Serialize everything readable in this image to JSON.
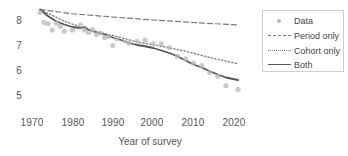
{
  "chart_data": {
    "type": "scatter",
    "title": "",
    "xlabel": "Year of survey",
    "ylabel": "",
    "xlim": [
      1968,
      2024
    ],
    "ylim": [
      4.7,
      8.45
    ],
    "grid": false,
    "xticks": [
      1970,
      1980,
      1990,
      2000,
      2010,
      2020
    ],
    "xtick_labels": [
      "1970",
      "1980",
      "1990",
      "2000",
      "2010",
      "2020"
    ],
    "yticks": [
      5,
      6,
      7,
      8
    ],
    "ytick_labels": [
      "5",
      "6",
      "7",
      "8"
    ],
    "legend": {
      "position": "upper right",
      "entries": [
        {
          "label": "Data",
          "style": "marker",
          "color": "#b8b8b8"
        },
        {
          "label": "Period only",
          "style": "dashed",
          "color": "#7a7a7a"
        },
        {
          "label": "Cohort only",
          "style": "dotted",
          "color": "#7a7a7a"
        },
        {
          "label": "Both",
          "style": "solid",
          "color": "#555555"
        }
      ]
    },
    "series": [
      {
        "name": "Data",
        "type": "scatter",
        "color": "#b8b8b8",
        "x": [
          1972,
          1973,
          1974,
          1975,
          1976,
          1977,
          1978,
          1980,
          1982,
          1983,
          1984,
          1985,
          1986,
          1987,
          1988,
          1989,
          1990,
          1991,
          1993,
          1994,
          1996,
          1998,
          2000,
          2002,
          2004,
          2006,
          2008,
          2010,
          2012,
          2014,
          2016,
          2018,
          2021
        ],
        "y": [
          8.3,
          7.9,
          7.85,
          7.6,
          7.88,
          7.75,
          7.55,
          7.6,
          7.8,
          7.6,
          7.5,
          7.62,
          7.42,
          7.48,
          7.3,
          7.35,
          6.98,
          7.25,
          7.18,
          7.08,
          7.15,
          7.2,
          7.05,
          7.05,
          6.9,
          6.55,
          6.45,
          6.28,
          6.18,
          5.9,
          5.75,
          5.38,
          5.22
        ]
      },
      {
        "name": "Period only",
        "type": "line",
        "color": "#7a7a7a",
        "x": [
          1972,
          1980,
          1990,
          2000,
          2010,
          2021
        ],
        "y": [
          8.42,
          8.25,
          8.12,
          8.0,
          7.9,
          7.8
        ]
      },
      {
        "name": "Cohort only",
        "type": "line",
        "color": "#7a7a7a",
        "x": [
          1972,
          1978,
          1984,
          1990,
          1996,
          2002,
          2008,
          2014,
          2021
        ],
        "y": [
          8.42,
          7.95,
          7.62,
          7.38,
          7.12,
          6.95,
          6.75,
          6.5,
          6.25
        ]
      },
      {
        "name": "Both",
        "type": "line",
        "color": "#555555",
        "x": [
          1972,
          1974,
          1976,
          1978,
          1980,
          1982,
          1983,
          1984,
          1986,
          1988,
          1990,
          1992,
          1994,
          1996,
          1998,
          2000,
          2002,
          2004,
          2006,
          2008,
          2010,
          2012,
          2014,
          2016,
          2018,
          2021
        ],
        "y": [
          8.42,
          8.15,
          7.95,
          7.82,
          7.72,
          7.68,
          7.72,
          7.6,
          7.5,
          7.42,
          7.3,
          7.2,
          7.08,
          7.0,
          6.95,
          6.88,
          6.78,
          6.68,
          6.55,
          6.38,
          6.22,
          6.1,
          5.95,
          5.82,
          5.7,
          5.6
        ]
      }
    ]
  }
}
